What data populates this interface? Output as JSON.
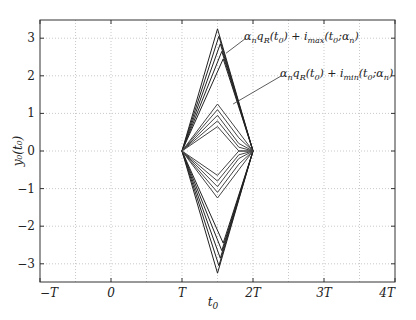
{
  "chart_data": {
    "type": "line",
    "title": "",
    "xlabel": "t_0",
    "ylabel": "y_0(t_0)",
    "xlim": [
      -1,
      4
    ],
    "ylim": [
      -3.5,
      3.5
    ],
    "grid": true,
    "x_unit": "T",
    "x_ticks": [
      -1,
      0,
      1,
      2,
      3,
      4
    ],
    "x_tick_labels": [
      "−T",
      "0",
      "T",
      "2T",
      "3T",
      "4T"
    ],
    "y_ticks": [
      3,
      2,
      1,
      0,
      -1,
      -2,
      -3
    ],
    "y_tick_labels": [
      "3",
      "2",
      "1",
      "0",
      "−1",
      "−2",
      "−3"
    ],
    "series": [
      {
        "name": "max_1",
        "group": "max",
        "x": [
          1,
          1.5,
          2
        ],
        "y": [
          0,
          3.25,
          0
        ]
      },
      {
        "name": "max_2",
        "group": "max",
        "x": [
          1,
          1.52,
          2
        ],
        "y": [
          0,
          3.05,
          0
        ]
      },
      {
        "name": "max_3",
        "group": "max",
        "x": [
          1,
          1.54,
          2
        ],
        "y": [
          0,
          2.85,
          0
        ]
      },
      {
        "name": "max_4",
        "group": "max",
        "x": [
          1,
          1.56,
          2
        ],
        "y": [
          0,
          2.65,
          0
        ]
      },
      {
        "name": "max_5",
        "group": "max",
        "x": [
          1,
          1.58,
          2
        ],
        "y": [
          0,
          2.45,
          0
        ]
      },
      {
        "name": "min_outer_1",
        "group": "max",
        "x": [
          1,
          1.5,
          2
        ],
        "y": [
          0,
          -3.25,
          0
        ]
      },
      {
        "name": "min_outer_2",
        "group": "max",
        "x": [
          1,
          1.52,
          2
        ],
        "y": [
          0,
          -3.05,
          0
        ]
      },
      {
        "name": "min_outer_3",
        "group": "max",
        "x": [
          1,
          1.54,
          2
        ],
        "y": [
          0,
          -2.85,
          0
        ]
      },
      {
        "name": "min_outer_4",
        "group": "max",
        "x": [
          1,
          1.56,
          2
        ],
        "y": [
          0,
          -2.65,
          0
        ]
      },
      {
        "name": "min_outer_5",
        "group": "max",
        "x": [
          1,
          1.58,
          2
        ],
        "y": [
          0,
          -2.45,
          0
        ]
      },
      {
        "name": "inner_up_1",
        "group": "min",
        "x": [
          1,
          1.5,
          1.8,
          2
        ],
        "y": [
          0,
          1.25,
          0.5,
          0
        ]
      },
      {
        "name": "inner_up_2",
        "group": "min",
        "x": [
          1,
          1.5,
          1.8,
          2
        ],
        "y": [
          0,
          1.1,
          0.35,
          0
        ]
      },
      {
        "name": "inner_up_3",
        "group": "min",
        "x": [
          1,
          1.5,
          1.8,
          2
        ],
        "y": [
          0,
          0.95,
          0.2,
          0
        ]
      },
      {
        "name": "inner_up_4",
        "group": "min",
        "x": [
          1,
          1.5,
          1.8,
          2
        ],
        "y": [
          0,
          0.8,
          0.1,
          0
        ]
      },
      {
        "name": "inner_up_5",
        "group": "min",
        "x": [
          1,
          1.5,
          1.8,
          2
        ],
        "y": [
          0,
          0.65,
          0.0,
          0
        ]
      },
      {
        "name": "inner_dn_1",
        "group": "min",
        "x": [
          1,
          1.5,
          1.8,
          2
        ],
        "y": [
          0,
          -1.25,
          -0.5,
          0
        ]
      },
      {
        "name": "inner_dn_2",
        "group": "min",
        "x": [
          1,
          1.5,
          1.8,
          2
        ],
        "y": [
          0,
          -1.1,
          -0.35,
          0
        ]
      },
      {
        "name": "inner_dn_3",
        "group": "min",
        "x": [
          1,
          1.5,
          1.8,
          2
        ],
        "y": [
          0,
          -0.95,
          -0.2,
          0
        ]
      },
      {
        "name": "inner_dn_4",
        "group": "min",
        "x": [
          1,
          1.5,
          1.8,
          2
        ],
        "y": [
          0,
          -0.8,
          -0.1,
          0
        ]
      },
      {
        "name": "inner_dn_5",
        "group": "min",
        "x": [
          1,
          1.5,
          1.8,
          2
        ],
        "y": [
          0,
          -0.65,
          0.0,
          0
        ]
      }
    ],
    "annotations": [
      {
        "text_parts": [
          "α",
          "n",
          "q",
          "R",
          "(t",
          "0",
          ") + i",
          "max",
          "(t",
          "0",
          ";α",
          "n",
          ")"
        ],
        "label": "α_n q_R(t_0) + i_max(t_0;α_n)",
        "arrow_from": [
          1.9,
          3.0
        ],
        "arrow_to": [
          1.62,
          2.6
        ]
      },
      {
        "text_parts": [
          "α",
          "n",
          "q",
          "R",
          "(t",
          "0",
          ") + i",
          "min",
          "(t",
          "0",
          ";α",
          "n",
          ")"
        ],
        "label": "α_n q_R(t_0) + i_min(t_0;α_n)",
        "arrow_from": [
          2.4,
          2.0
        ],
        "arrow_to": [
          1.72,
          1.25
        ]
      }
    ]
  },
  "axes": {
    "xlabel_main": "t",
    "xlabel_sub": "0",
    "ylabel_text": "y₀(t₀)"
  },
  "annotations_text": {
    "max": {
      "a": "α",
      "n": "n",
      "q": "q",
      "R": "R",
      "t": "(t",
      "zero": "0",
      "plus": ") + i",
      "sub": "max",
      "t2": "(t",
      "zero2": "0",
      "semi": ";α",
      "n2": "n",
      "close": ")"
    },
    "min": {
      "a": "α",
      "n": "n",
      "q": "q",
      "R": "R",
      "t": "(t",
      "zero": "0",
      "plus": ") + i",
      "sub": "min",
      "t2": "(t",
      "zero2": "0",
      "semi": ";α",
      "n2": "n",
      "close": ")"
    }
  }
}
